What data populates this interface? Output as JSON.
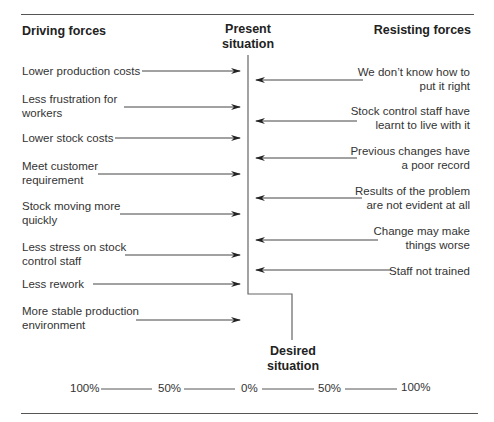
{
  "headings": {
    "driving": "Driving forces",
    "present": "Present situation",
    "present_line1": "Present",
    "present_line2": "situation",
    "resisting": "Resisting forces",
    "desired_line1": "Desired",
    "desired_line2": "situation"
  },
  "driving_forces": [
    {
      "line1": "Lower production costs",
      "line2": ""
    },
    {
      "line1": "Less frustration for",
      "line2": "workers"
    },
    {
      "line1": "Lower stock costs",
      "line2": ""
    },
    {
      "line1": "Meet customer",
      "line2": "requirement"
    },
    {
      "line1": "Stock moving more",
      "line2": "quickly"
    },
    {
      "line1": "Less stress on stock",
      "line2": "control staff"
    },
    {
      "line1": "Less rework",
      "line2": ""
    },
    {
      "line1": "More stable production",
      "line2": "environment"
    }
  ],
  "resisting_forces": [
    {
      "line1": "We don’t know how to",
      "line2": "put it right"
    },
    {
      "line1": "Stock control staff have",
      "line2": "learnt to live with it"
    },
    {
      "line1": "Previous changes have",
      "line2": "a poor record"
    },
    {
      "line1": "Results of the problem",
      "line2": "are not evident at all"
    },
    {
      "line1": "Change may make",
      "line2": "things worse"
    },
    {
      "line1": "Staff not trained",
      "line2": ""
    }
  ],
  "scale": [
    "100%",
    "50%",
    "0%",
    "50%",
    "100%"
  ],
  "colors": {
    "line": "#555555",
    "arrow": "#222222",
    "text": "#333333"
  }
}
